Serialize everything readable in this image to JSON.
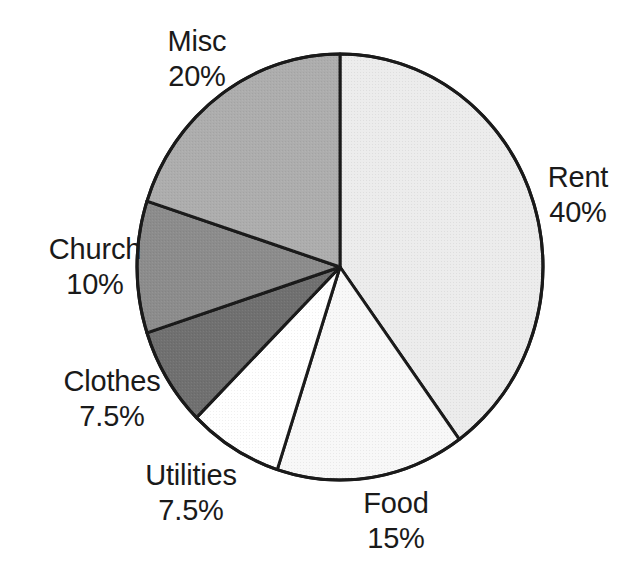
{
  "chart_data": {
    "type": "pie",
    "title": "",
    "subtitle": "",
    "xlabel": "",
    "ylabel": "",
    "grid": false,
    "legend": "none",
    "labels_position": "outside-adjacent",
    "start_angle_deg": 0,
    "direction": "clockwise",
    "units": "percent",
    "categories": [
      "Rent",
      "Food",
      "Utilities",
      "Clothes",
      "Church",
      "Misc"
    ],
    "values": [
      40,
      15,
      7.5,
      7.5,
      10,
      20
    ],
    "value_labels": [
      "40%",
      "15%",
      "7.5%",
      "7.5%",
      "10%",
      "20%"
    ],
    "slices": [
      {
        "name": "Rent",
        "value": 40,
        "value_label": "40%",
        "color": "#ececec",
        "start_deg": 0,
        "end_deg": 144,
        "label_name": "Rent",
        "label_value": "40%"
      },
      {
        "name": "Food",
        "value": 15,
        "value_label": "15%",
        "color": "#f8f8f8",
        "start_deg": 144,
        "end_deg": 198,
        "label_name": "Food",
        "label_value": "15%"
      },
      {
        "name": "Utilities",
        "value": 7.5,
        "value_label": "7.5%",
        "color": "#ffffff",
        "start_deg": 198,
        "end_deg": 225,
        "label_name": "Utilities",
        "label_value": "7.5%"
      },
      {
        "name": "Clothes",
        "value": 7.5,
        "value_label": "7.5%",
        "color": "#707070",
        "start_deg": 225,
        "end_deg": 252,
        "label_name": "Clothes",
        "label_value": "7.5%"
      },
      {
        "name": "Church",
        "value": 10,
        "value_label": "10%",
        "color": "#8c8c8c",
        "start_deg": 252,
        "end_deg": 288,
        "label_name": "Church",
        "label_value": "10%"
      },
      {
        "name": "Misc",
        "value": 20,
        "value_label": "20%",
        "color": "#adadad",
        "start_deg": 288,
        "end_deg": 360,
        "label_name": "Misc",
        "label_value": "20%"
      }
    ],
    "geometry": {
      "center_x": 340,
      "center_y": 267,
      "radius_x": 203,
      "radius_y": 213,
      "outline_color": "#1a1a1a",
      "outline_width": 3
    }
  }
}
